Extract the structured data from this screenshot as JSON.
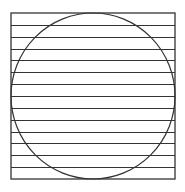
{
  "diagram": {
    "square": {
      "x": 11,
      "y": 13,
      "width": 164,
      "height": 166
    },
    "circle": {
      "cx": 93,
      "cy": 96,
      "rx": 82,
      "ry": 83
    },
    "horizontal_line_count": 13,
    "stroke_color": "#333333",
    "background": "#ffffff"
  }
}
